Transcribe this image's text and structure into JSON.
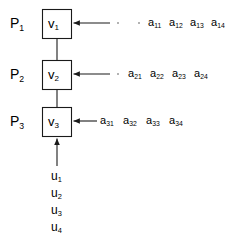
{
  "diagram": {
    "background_color": "#ffffff",
    "stroke_color": "#1a1a1a",
    "text_color": "#000000",
    "dot_color": "#9a9a9a",
    "stages": [
      {
        "period_label": "P",
        "period_sub": "1",
        "block_label": "v",
        "block_sub": "1",
        "inputs": [
          {
            "base": "a",
            "sub": "11"
          },
          {
            "base": "a",
            "sub": "12"
          },
          {
            "base": "a",
            "sub": "13"
          },
          {
            "base": "a",
            "sub": "14"
          }
        ],
        "leader_dots": 2
      },
      {
        "period_label": "P",
        "period_sub": "2",
        "block_label": "v",
        "block_sub": "2",
        "inputs": [
          {
            "base": "a",
            "sub": "21"
          },
          {
            "base": "a",
            "sub": "22"
          },
          {
            "base": "a",
            "sub": "23"
          },
          {
            "base": "a",
            "sub": "24"
          }
        ],
        "leader_dots": 1
      },
      {
        "period_label": "P",
        "period_sub": "3",
        "block_label": "v",
        "block_sub": "3",
        "inputs": [
          {
            "base": "a",
            "sub": "31"
          },
          {
            "base": "a",
            "sub": "32"
          },
          {
            "base": "a",
            "sub": "33"
          },
          {
            "base": "a",
            "sub": "34"
          }
        ],
        "leader_dots": 0
      }
    ],
    "bottom_inputs": [
      {
        "base": "u",
        "sub": "1"
      },
      {
        "base": "u",
        "sub": "2"
      },
      {
        "base": "u",
        "sub": "3"
      },
      {
        "base": "u",
        "sub": "4"
      }
    ]
  }
}
